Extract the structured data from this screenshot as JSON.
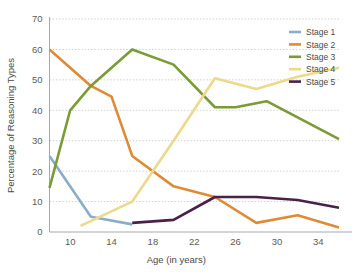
{
  "chart_data": {
    "type": "line",
    "title": "",
    "xlabel": "Age (in years)",
    "ylabel": "Percentage of Reasoning Types",
    "xlim": [
      8,
      36
    ],
    "ylim": [
      0,
      70
    ],
    "xticks": [
      10,
      14,
      18,
      22,
      26,
      30,
      34
    ],
    "yticks": [
      0,
      10,
      20,
      30,
      40,
      50,
      60,
      70
    ],
    "grid": true,
    "legend_position": "top-right",
    "series": [
      {
        "name": "Stage 1",
        "color": "#8aaec8",
        "x": [
          8,
          12,
          16
        ],
        "values": [
          25,
          5,
          2.5
        ]
      },
      {
        "name": "Stage 2",
        "color": "#df8a35",
        "x": [
          8,
          12,
          14,
          16,
          20,
          24,
          28,
          32,
          36
        ],
        "values": [
          60,
          48,
          44.5,
          25,
          15,
          11.5,
          3,
          5.5,
          1.5
        ]
      },
      {
        "name": "Stage 3",
        "color": "#7a9b36",
        "x": [
          8,
          10,
          12,
          16,
          20,
          24,
          26,
          29,
          36
        ],
        "values": [
          14.5,
          40,
          48,
          60,
          55,
          41,
          41,
          43,
          30.5
        ]
      },
      {
        "name": "Stage 4",
        "color": "#edd98a",
        "x": [
          11,
          16,
          20,
          24,
          28,
          32,
          36
        ],
        "values": [
          2,
          10,
          30,
          50.5,
          47,
          51,
          54
        ]
      },
      {
        "name": "Stage 5",
        "color": "#49204a",
        "x": [
          16,
          20,
          24,
          28,
          32,
          36
        ],
        "values": [
          3,
          4,
          11.5,
          11.5,
          10.5,
          8
        ]
      }
    ]
  },
  "legend": {
    "items": [
      {
        "label": "Stage 1"
      },
      {
        "label": "Stage 2"
      },
      {
        "label": "Stage 3"
      },
      {
        "label": "Stage 4"
      },
      {
        "label": "Stage 5"
      }
    ]
  }
}
